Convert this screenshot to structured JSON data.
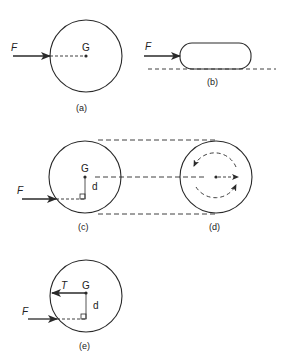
{
  "diagram": {
    "colors": {
      "stroke": "#2a2a2a",
      "background": "#ffffff"
    },
    "panels": [
      {
        "id": "a",
        "caption": "(a)",
        "force_label": "F",
        "center_label": "G"
      },
      {
        "id": "b",
        "caption": "(b)",
        "force_label": "F"
      },
      {
        "id": "c",
        "caption": "(c)",
        "force_label": "F",
        "center_label": "G",
        "distance_label": "d"
      },
      {
        "id": "d",
        "caption": "(d)"
      },
      {
        "id": "e",
        "caption": "(e)",
        "force_label": "F",
        "center_label": "G",
        "distance_label": "d",
        "reaction_label": "T"
      }
    ]
  }
}
